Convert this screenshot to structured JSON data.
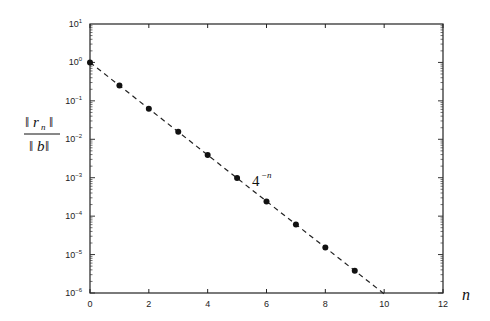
{
  "chart_data": {
    "type": "scatter",
    "title": "",
    "xlabel": "n",
    "ylabel": "||r_n|| / ||b||",
    "yscale": "log",
    "xlim": [
      0,
      12
    ],
    "ylim": [
      1e-06,
      10
    ],
    "xticks": [
      0,
      2,
      4,
      6,
      8,
      10,
      12
    ],
    "xtick_labels": [
      "0",
      "2",
      "4",
      "6",
      "8",
      "10",
      "12"
    ],
    "yticks_exp": [
      1,
      0,
      -1,
      -2,
      -3,
      -4,
      -5,
      -6
    ],
    "ytick_labels": [
      "10^1",
      "10^0",
      "10^-1",
      "10^-2",
      "10^-3",
      "10^-4",
      "10^-5",
      "10^-6"
    ],
    "grid": false,
    "legend": null,
    "series": [
      {
        "name": "residual",
        "style": "markers",
        "marker": "filled-circle",
        "x": [
          0,
          1,
          2,
          3,
          4,
          5,
          6,
          7,
          8,
          9
        ],
        "y": [
          1.0,
          0.25,
          0.0625,
          0.0156,
          0.0039,
          0.00098,
          0.00024,
          6.1e-05,
          1.53e-05,
          3.8e-06
        ]
      },
      {
        "name": "4^-n",
        "style": "dashed-line",
        "x": [
          0,
          10
        ],
        "y": [
          1.0,
          9.5e-07
        ]
      }
    ],
    "annotations": [
      {
        "text": "4^-n",
        "x": 5.4,
        "y": 0.0007
      }
    ]
  },
  "labels": {
    "ylabel_num": "r",
    "ylabel_sub": "n",
    "ylabel_den": "b",
    "xlabel": "n",
    "annotation_base": "4",
    "annotation_exp": "−n"
  }
}
